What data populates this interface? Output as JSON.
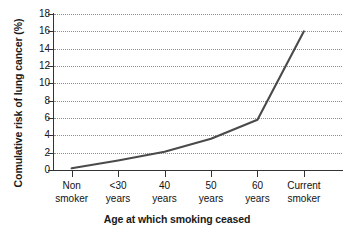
{
  "chart_data": {
    "type": "line",
    "title": "",
    "xlabel": "Age at which smoking ceased",
    "ylabel": "Comulative risk of lung cancer (%)",
    "categories": [
      "Non smoker",
      "<30 years",
      "40 years",
      "50 years",
      "60 years",
      "Current smoker"
    ],
    "category_labels": [
      {
        "line1": "Non",
        "line2": "smoker"
      },
      {
        "line1": "<30",
        "line2": "years"
      },
      {
        "line1": "40",
        "line2": "years"
      },
      {
        "line1": "50",
        "line2": "years"
      },
      {
        "line1": "60",
        "line2": "years"
      },
      {
        "line1": "Current",
        "line2": "smoker"
      }
    ],
    "values": [
      0.2,
      1.1,
      2.1,
      3.6,
      5.8,
      16.0
    ],
    "ylim": [
      0,
      18
    ],
    "ytick_labels": [
      "0",
      "2",
      "4",
      "6",
      "8",
      "10",
      "12",
      "14",
      "16",
      "18"
    ],
    "ytick_values": [
      0,
      2,
      4,
      6,
      8,
      10,
      12,
      14,
      16,
      18
    ],
    "grid": "horizontal-dotted",
    "legend": "none",
    "line_color": "#4a4a4a",
    "grid_color": "#8e8e8e",
    "axis_color": "#333333"
  }
}
